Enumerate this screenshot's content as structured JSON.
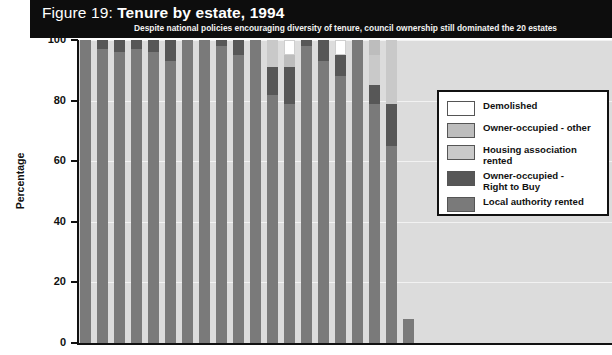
{
  "figure": {
    "title_prefix": "Figure 19: ",
    "title_main": "Tenure by estate, 1994",
    "subtitle": "Despite national policies encouraging diversity of tenure, council ownership still dominated the 20 estates"
  },
  "colors": {
    "title_band": "#0d0d0d",
    "plot_background": "#dcdcdc",
    "axis": "#111111",
    "demolished": "#ffffff",
    "owner_occupied_other": "#bdbdbd",
    "housing_association_rented": "#c9c9c9",
    "owner_occupied_rtb": "#575757",
    "local_authority_rented": "#7a7a7a"
  },
  "legend": {
    "position": "right",
    "items": [
      {
        "label": "Demolished",
        "color": "#ffffff"
      },
      {
        "label": "Owner-occupied - other",
        "color": "#bdbdbd"
      },
      {
        "label": "Housing association\nrented",
        "color": "#c9c9c9"
      },
      {
        "label": "Owner-occupied -\nRight to Buy",
        "color": "#575757"
      },
      {
        "label": "Local authority rented",
        "color": "#7a7a7a"
      }
    ]
  },
  "chart_data": {
    "type": "bar",
    "stacked": true,
    "title": "Figure 19: Tenure by estate, 1994",
    "subtitle": "Despite national policies encouraging diversity of tenure, council ownership still dominated the 20 estates",
    "xlabel": "",
    "ylabel": "Percentage",
    "ylim": [
      0,
      100
    ],
    "yticks": [
      0,
      20,
      40,
      60,
      80,
      100
    ],
    "grid": true,
    "categories": [
      "1",
      "2",
      "3",
      "4",
      "5",
      "6",
      "7",
      "8",
      "9",
      "10",
      "11",
      "12",
      "13",
      "14",
      "15",
      "16",
      "17",
      "18",
      "19",
      "20"
    ],
    "series": [
      {
        "name": "Local authority rented",
        "color": "#7a7a7a",
        "values": [
          100,
          97,
          96,
          97,
          96,
          93,
          100,
          100,
          98,
          95,
          100,
          82,
          79,
          98,
          93,
          88,
          100,
          79,
          65,
          8
        ]
      },
      {
        "name": "Owner-occupied - Right to Buy",
        "color": "#575757",
        "values": [
          0,
          3,
          4,
          3,
          4,
          7,
          0,
          0,
          2,
          5,
          0,
          9,
          12,
          2,
          7,
          7,
          0,
          6,
          14,
          0
        ]
      },
      {
        "name": "Housing association rented",
        "color": "#c9c9c9",
        "values": [
          0,
          0,
          0,
          0,
          0,
          0,
          0,
          0,
          0,
          0,
          0,
          9,
          0,
          0,
          0,
          0,
          0,
          10,
          21,
          0
        ]
      },
      {
        "name": "Owner-occupied - other",
        "color": "#bdbdbd",
        "values": [
          0,
          0,
          0,
          0,
          0,
          0,
          0,
          0,
          0,
          0,
          0,
          0,
          4,
          0,
          0,
          0,
          0,
          5,
          0,
          0
        ]
      },
      {
        "name": "Demolished",
        "color": "#ffffff",
        "values": [
          0,
          0,
          0,
          0,
          0,
          0,
          0,
          0,
          0,
          0,
          0,
          0,
          5,
          0,
          0,
          5,
          0,
          0,
          0,
          0
        ]
      }
    ]
  }
}
